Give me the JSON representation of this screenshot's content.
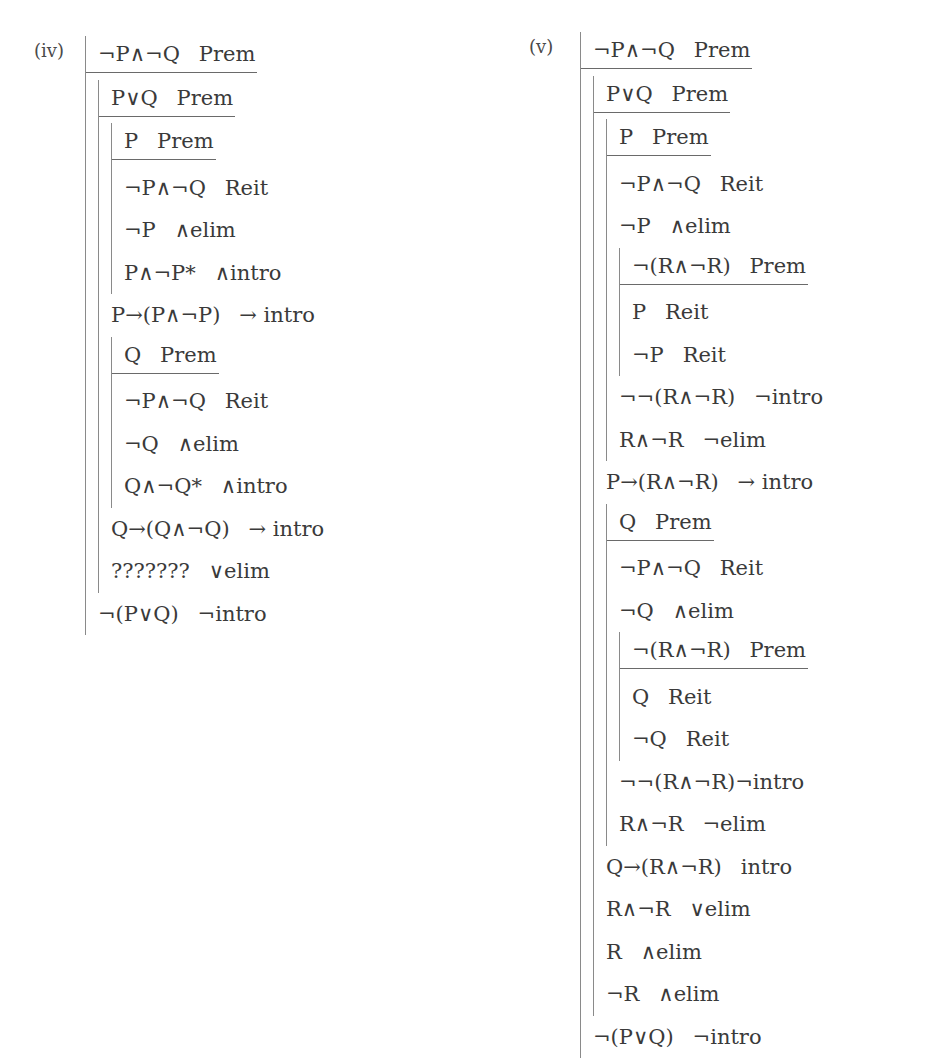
{
  "page": {
    "top_cutoff_text": "BAN Y ANSWE"
  },
  "proofs": [
    {
      "id": "iv",
      "label": "(iv)",
      "tree": {
        "premise": {
          "formula": "¬P∧¬Q",
          "rule": "Prem"
        },
        "items": [
          {
            "premise": {
              "formula": "P∨Q",
              "rule": "Prem"
            },
            "items": [
              {
                "premise": {
                  "formula": "P",
                  "rule": "Prem"
                },
                "items": [
                  {
                    "formula": "¬P∧¬Q",
                    "rule": "Reit"
                  },
                  {
                    "formula": "¬P",
                    "rule": "∧elim"
                  },
                  {
                    "formula": "P∧¬P*",
                    "rule": "∧intro"
                  }
                ]
              },
              {
                "formula": "P→(P∧¬P)",
                "rule": "→ intro"
              },
              {
                "premise": {
                  "formula": "Q",
                  "rule": "Prem"
                },
                "items": [
                  {
                    "formula": "¬P∧¬Q",
                    "rule": "Reit"
                  },
                  {
                    "formula": "¬Q",
                    "rule": "∧elim"
                  },
                  {
                    "formula": "Q∧¬Q*",
                    "rule": "∧intro"
                  }
                ]
              },
              {
                "formula": "Q→(Q∧¬Q)",
                "rule": "→ intro"
              },
              {
                "formula": "???????",
                "rule": "∨elim"
              }
            ]
          },
          {
            "formula": "¬(P∨Q)",
            "rule": "¬intro"
          }
        ]
      }
    },
    {
      "id": "v",
      "label": "(v)",
      "tree": {
        "premise": {
          "formula": "¬P∧¬Q",
          "rule": "Prem"
        },
        "items": [
          {
            "premise": {
              "formula": "P∨Q",
              "rule": "Prem"
            },
            "items": [
              {
                "premise": {
                  "formula": "P",
                  "rule": "Prem"
                },
                "items": [
                  {
                    "formula": "¬P∧¬Q",
                    "rule": "Reit"
                  },
                  {
                    "formula": "¬P",
                    "rule": "∧elim"
                  },
                  {
                    "premise": {
                      "formula": "¬(R∧¬R)",
                      "rule": "Prem"
                    },
                    "items": [
                      {
                        "formula": "P",
                        "rule": "Reit"
                      },
                      {
                        "formula": "¬P",
                        "rule": "Reit"
                      }
                    ]
                  },
                  {
                    "formula": "¬¬(R∧¬R)",
                    "rule": "¬intro"
                  },
                  {
                    "formula": "R∧¬R",
                    "rule": "¬elim"
                  }
                ]
              },
              {
                "formula": "P→(R∧¬R)",
                "rule": "→ intro"
              },
              {
                "premise": {
                  "formula": "Q",
                  "rule": "Prem"
                },
                "items": [
                  {
                    "formula": "¬P∧¬Q",
                    "rule": "Reit"
                  },
                  {
                    "formula": "¬Q",
                    "rule": "∧elim"
                  },
                  {
                    "premise": {
                      "formula": "¬(R∧¬R)",
                      "rule": "Prem"
                    },
                    "items": [
                      {
                        "formula": "Q",
                        "rule": "Reit"
                      },
                      {
                        "formula": "¬Q",
                        "rule": "Reit"
                      }
                    ]
                  },
                  {
                    "formula": "¬¬(R∧¬R)",
                    "rule": "¬intro",
                    "tight": true
                  },
                  {
                    "formula": "R∧¬R",
                    "rule": "¬elim"
                  }
                ]
              },
              {
                "formula": "Q→(R∧¬R)",
                "rule": "intro"
              },
              {
                "formula": "R∧¬R",
                "rule": "∨elim"
              },
              {
                "formula": "R",
                "rule": "∧elim"
              },
              {
                "formula": "¬R",
                "rule": "∧elim"
              }
            ]
          },
          {
            "formula": "¬(P∨Q)",
            "rule": "¬intro"
          }
        ]
      }
    }
  ]
}
